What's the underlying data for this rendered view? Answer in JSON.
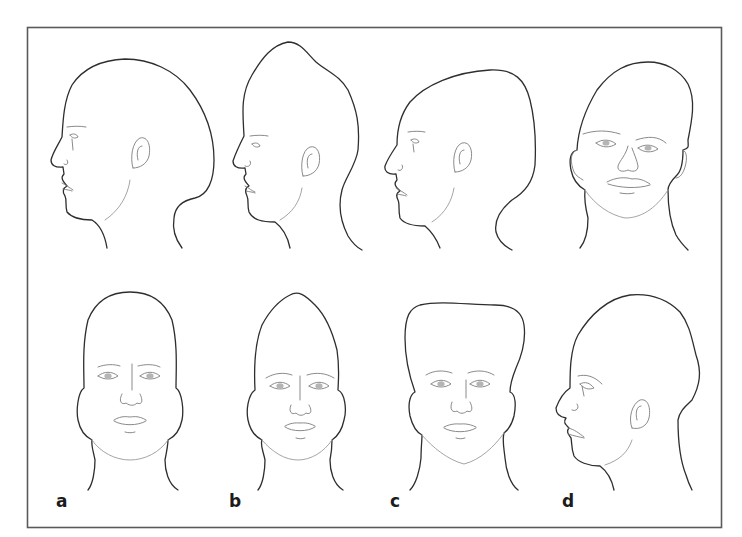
{
  "figure": {
    "frame_color": "#5a5a5a",
    "line_color": "#2e2e2e",
    "background": "#ffffff",
    "rows": [
      {
        "name": "top-row",
        "panels": [
          {
            "id": "a-lateral",
            "view": "lateral-left",
            "head_shape": "elongated-posterior"
          },
          {
            "id": "b-lateral",
            "view": "lateral-left",
            "head_shape": "pointed-vertex"
          },
          {
            "id": "c-lateral",
            "view": "lateral-left",
            "head_shape": "broad-flat-occiput"
          },
          {
            "id": "d-frontal",
            "view": "frontal",
            "head_shape": "asymmetric"
          }
        ]
      },
      {
        "name": "bottom-row",
        "panels": [
          {
            "id": "a-frontal",
            "view": "frontal",
            "head_shape": "narrow-elongated",
            "label": "a"
          },
          {
            "id": "b-frontal",
            "view": "frontal",
            "head_shape": "pointed-vertex",
            "label": "b"
          },
          {
            "id": "c-frontal",
            "view": "frontal",
            "head_shape": "broad-flat-top",
            "label": "c"
          },
          {
            "id": "d-lateral",
            "view": "lateral-left",
            "head_shape": "asymmetric",
            "label": "d"
          }
        ]
      }
    ],
    "labels": [
      "a",
      "b",
      "c",
      "d"
    ]
  }
}
